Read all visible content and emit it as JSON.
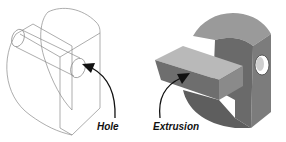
{
  "figures": [
    {
      "id": "wireframe-model",
      "style": "wireframe",
      "callout": {
        "label": "Hole"
      }
    },
    {
      "id": "shaded-model",
      "style": "shaded",
      "callout": {
        "label": "Extrusion"
      }
    }
  ],
  "colors": {
    "wire": "#8a8a8a",
    "shade_dark": "#5e5e5e",
    "shade_mid": "#7c7c7c",
    "shade_light": "#a8a8a8",
    "shade_top": "#b9b9b9",
    "arrow": "#111111"
  }
}
